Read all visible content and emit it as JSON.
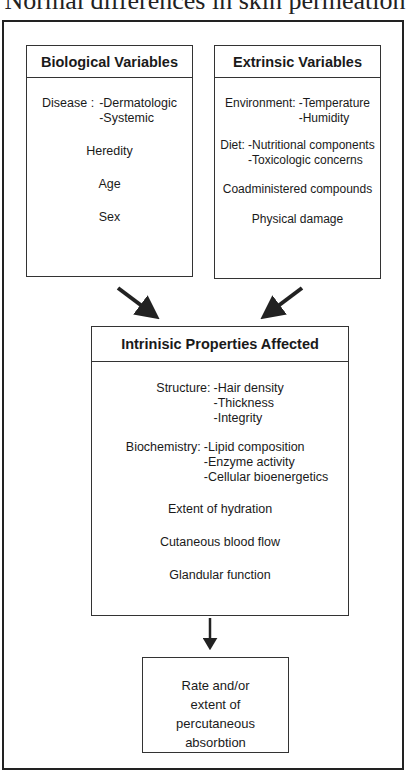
{
  "page_title": "Normal differences in skin permeation",
  "boxes": {
    "biological": {
      "title": "Biological Variables",
      "disease_label": "Disease :",
      "disease_items": [
        "-Dermatologic",
        "-Systemic"
      ],
      "items": [
        "Heredity",
        "Age",
        "Sex"
      ]
    },
    "extrinsic": {
      "title": "Extrinsic Variables",
      "environment_label": "Environment:",
      "environment_items": [
        "-Temperature",
        "-Humidity"
      ],
      "diet_label": "Diet:",
      "diet_items": [
        "-Nutritional components",
        "-Toxicologic concerns"
      ],
      "items": [
        "Coadministered compounds",
        "Physical damage"
      ]
    },
    "intrinsic": {
      "title": "Intrinisic Properties Affected",
      "structure_label": "Structure:",
      "structure_items": [
        "-Hair density",
        "-Thickness",
        "-Integrity"
      ],
      "biochemistry_label": "Biochemistry:",
      "biochemistry_items": [
        "-Lipid composition",
        "-Enzyme activity",
        "-Cellular bioenergetics"
      ],
      "items": [
        "Extent of hydration",
        "Cutaneous blood flow",
        "Glandular function"
      ]
    },
    "result": {
      "lines": [
        "Rate and/or",
        "extent of",
        "percutaneous",
        "absorbtion"
      ]
    }
  },
  "colors": {
    "stroke": "#222222",
    "background": "#ffffff"
  }
}
